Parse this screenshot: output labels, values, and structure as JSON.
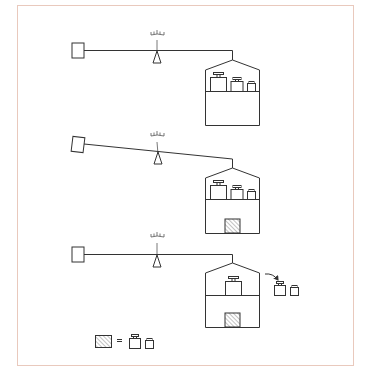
{
  "figure": {
    "description": "Balance scale experiment: three stages showing a counterweight box on a lever balanced against a house-shaped container holding weights; a hatched block replaces two removed weights.",
    "colors": {
      "frame": "#e9c9bd",
      "line": "#333333",
      "hatch": "#888888",
      "background": "#ffffff"
    },
    "panels": [
      {
        "id": "panel-1",
        "state": "balanced",
        "beam_tilt": "level",
        "shelf_weights": [
          "large",
          "medium",
          "small"
        ],
        "lower_compartment": "empty",
        "removed_weights": []
      },
      {
        "id": "panel-2",
        "state": "unbalanced",
        "beam_tilt": "right side down",
        "shelf_weights": [
          "large",
          "medium",
          "small"
        ],
        "lower_compartment": "hatched block",
        "removed_weights": []
      },
      {
        "id": "panel-3",
        "state": "balanced",
        "beam_tilt": "level",
        "shelf_weights": [
          "large"
        ],
        "lower_compartment": "hatched block",
        "removed_weights": [
          "medium",
          "small"
        ],
        "arrow": "weights moved out of container"
      }
    ],
    "legend": {
      "lhs": "hatched block",
      "operator": "=",
      "rhs": [
        "medium",
        "small"
      ],
      "operator_label": "equals"
    }
  }
}
